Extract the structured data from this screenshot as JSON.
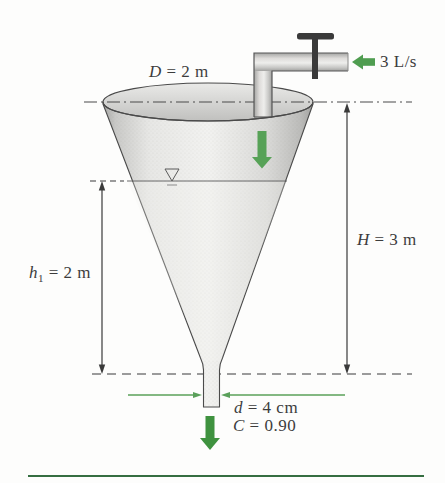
{
  "figure": {
    "type": "conical-funnel-tank-diagram",
    "inflow": {
      "rate_label": "3 L/s"
    },
    "dimensions": {
      "top_diameter": {
        "symbol": "D",
        "value": " = 2 m"
      },
      "total_height": {
        "symbol": "H",
        "value": " = 3 m"
      },
      "water_depth": {
        "symbol": "h",
        "subscript": "1",
        "value": " = 2 m"
      },
      "orifice_diameter": {
        "symbol": "d",
        "value": " = 4 cm"
      },
      "discharge_coefficient": {
        "symbol": "C",
        "value": " = 0.90"
      }
    },
    "icons": {
      "inflow_arrow": "green-arrow-left",
      "infall_arrow": "green-arrow-down",
      "outflow_arrow": "green-arrow-down",
      "orifice_width_arrows": "green-inward-arrows",
      "water_surface_marker": "nabla-triangle",
      "valve": "tee-handle-valve"
    },
    "colors": {
      "arrow_green": "#4f9d50",
      "dimension_green": "#5aa05a",
      "bottom_rule_green": "#356e41",
      "ink": "#3c3c3c",
      "outline_gray": "#4a4a4a",
      "metal_light": "#f2f2f0",
      "metal_dark": "#a6a6a4"
    }
  }
}
